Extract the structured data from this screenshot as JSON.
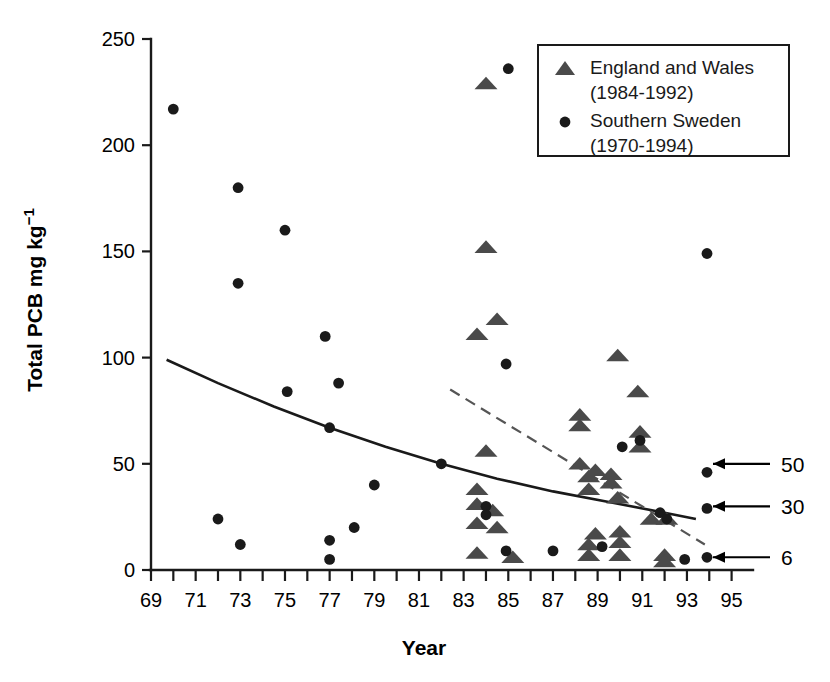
{
  "chart_data": {
    "type": "scatter",
    "title": "",
    "xlabel": "Year",
    "ylabel": "Total PCB mg kg−1",
    "ylabel_parts": {
      "main": "Total PCB mg kg",
      "exponent": "−1"
    },
    "xlim": [
      69,
      95.6
    ],
    "ylim": [
      0,
      250
    ],
    "grid": false,
    "xticks": [
      69,
      71,
      73,
      75,
      77,
      79,
      81,
      83,
      85,
      87,
      89,
      91,
      93,
      95
    ],
    "xtick_labels": [
      "69",
      "71",
      "73",
      "75",
      "77",
      "79",
      "81",
      "83",
      "85",
      "87",
      "89",
      "91",
      "93",
      "95"
    ],
    "x_minor_ticks": [
      70,
      72,
      74,
      76,
      78,
      80,
      82,
      84,
      86,
      88,
      90,
      92,
      94
    ],
    "yticks": [
      0,
      50,
      100,
      150,
      200,
      250
    ],
    "ytick_labels": [
      "0",
      "50",
      "100",
      "150",
      "200",
      "250"
    ],
    "legend_position": "top-right",
    "series": [
      {
        "name": "England and Wales",
        "period": "(1984-1992)",
        "label": "England and Wales",
        "sublabel": "(1984-1992)",
        "marker": "triangle",
        "color": "#4a4a4a",
        "points": [
          [
            84.0,
            229
          ],
          [
            84.0,
            152
          ],
          [
            84.5,
            118
          ],
          [
            83.6,
            111
          ],
          [
            84.0,
            56
          ],
          [
            83.6,
            38
          ],
          [
            83.6,
            31
          ],
          [
            83.6,
            22
          ],
          [
            83.6,
            8
          ],
          [
            84.3,
            28
          ],
          [
            84.5,
            20
          ],
          [
            85.2,
            6
          ],
          [
            88.2,
            73
          ],
          [
            88.2,
            68
          ],
          [
            88.6,
            44
          ],
          [
            88.6,
            38
          ],
          [
            88.2,
            50
          ],
          [
            88.9,
            47
          ],
          [
            88.9,
            17
          ],
          [
            88.6,
            12
          ],
          [
            88.6,
            7
          ],
          [
            89.9,
            101
          ],
          [
            89.6,
            45
          ],
          [
            89.6,
            41
          ],
          [
            89.9,
            34
          ],
          [
            90.0,
            18
          ],
          [
            90.0,
            13
          ],
          [
            90.0,
            7
          ],
          [
            90.8,
            84
          ],
          [
            90.9,
            65
          ],
          [
            90.9,
            58
          ],
          [
            91.4,
            24
          ],
          [
            92.1,
            24
          ],
          [
            92.0,
            7
          ],
          [
            92.0,
            4
          ]
        ]
      },
      {
        "name": "Southern Sweden",
        "period": "(1970-1994)",
        "label": "Southern Sweden",
        "sublabel": "(1970-1994)",
        "marker": "circle",
        "color": "#1a1a1a",
        "points": [
          [
            70.0,
            217
          ],
          [
            72.9,
            180
          ],
          [
            72.9,
            135
          ],
          [
            75.0,
            160
          ],
          [
            76.8,
            110
          ],
          [
            77.4,
            88
          ],
          [
            75.1,
            84
          ],
          [
            77.0,
            67
          ],
          [
            82.0,
            50
          ],
          [
            85.0,
            236
          ],
          [
            84.9,
            97
          ],
          [
            72.0,
            24
          ],
          [
            73.0,
            12
          ],
          [
            77.0,
            14
          ],
          [
            77.0,
            5
          ],
          [
            78.1,
            20
          ],
          [
            79.0,
            40
          ],
          [
            84.0,
            30
          ],
          [
            84.0,
            26
          ],
          [
            84.9,
            9
          ],
          [
            87.0,
            9
          ],
          [
            89.2,
            11
          ],
          [
            90.1,
            58
          ],
          [
            90.9,
            61
          ],
          [
            91.8,
            27
          ],
          [
            92.1,
            24
          ],
          [
            92.9,
            5
          ],
          [
            93.9,
            149
          ],
          [
            93.9,
            46
          ],
          [
            93.9,
            29
          ],
          [
            93.9,
            6
          ]
        ]
      }
    ],
    "trend_lines": [
      {
        "name": "southern-sweden-trend",
        "style": "solid",
        "color": "#1a1a1a",
        "points": [
          [
            69.7,
            99
          ],
          [
            72.0,
            88
          ],
          [
            74.5,
            77
          ],
          [
            77.0,
            67
          ],
          [
            79.5,
            58
          ],
          [
            82.0,
            50
          ],
          [
            84.5,
            43
          ],
          [
            87.0,
            37
          ],
          [
            89.5,
            32
          ],
          [
            92.0,
            27
          ],
          [
            93.4,
            24
          ]
        ]
      },
      {
        "name": "england-wales-trend",
        "style": "dashed",
        "color": "#555555",
        "points": [
          [
            82.4,
            85
          ],
          [
            93.8,
            12
          ]
        ]
      }
    ],
    "annotations": [
      {
        "name": "annotation-50",
        "label": "50",
        "value": 50,
        "x": 93.9,
        "y": 50
      },
      {
        "name": "annotation-30",
        "label": "30",
        "value": 30,
        "x": 93.9,
        "y": 30
      },
      {
        "name": "annotation-6",
        "label": "6",
        "value": 6,
        "x": 93.9,
        "y": 6
      }
    ]
  }
}
